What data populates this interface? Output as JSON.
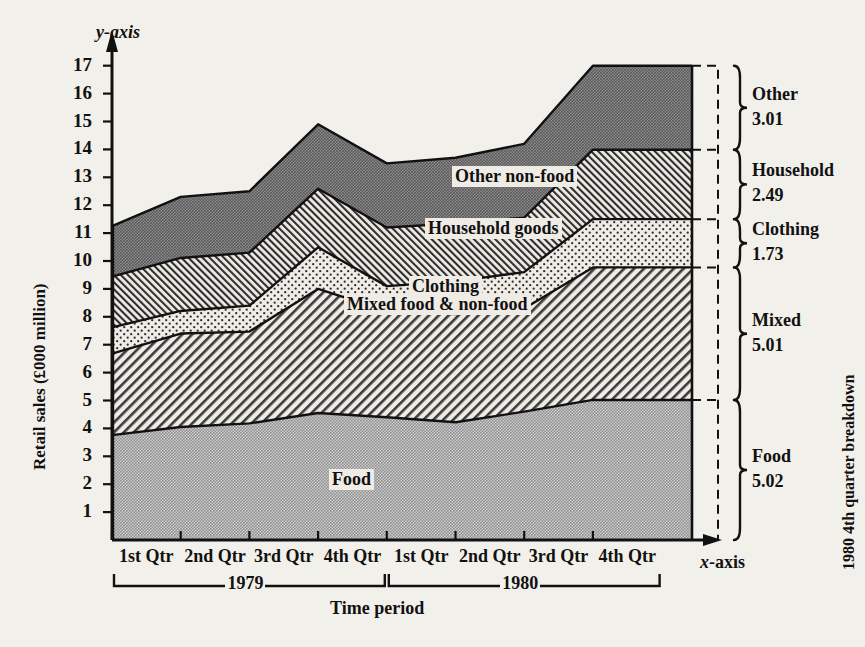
{
  "chart_data": {
    "type": "area",
    "title": "",
    "xlabel": "Time period",
    "ylabel": "Retail sales (£000 million)",
    "x_axis_name": "x-axis",
    "y_axis_name": "y-axis",
    "ylim": [
      0,
      17.6
    ],
    "yticks": [
      1,
      2,
      3,
      4,
      5,
      6,
      7,
      8,
      9,
      10,
      11,
      12,
      13,
      14,
      15,
      16,
      17
    ],
    "grid": false,
    "stacked": true,
    "categories": [
      "1st Qtr",
      "2nd Qtr",
      "3rd Qtr",
      "4th Qtr",
      "1st Qtr",
      "2nd Qtr",
      "3rd Qtr",
      "4th Qtr"
    ],
    "group_labels": [
      {
        "label": "1979",
        "from": 0,
        "to": 3
      },
      {
        "label": "1980",
        "from": 4,
        "to": 7
      }
    ],
    "series": [
      {
        "name": "Food",
        "values": [
          3.76,
          4.05,
          4.18,
          4.55,
          4.4,
          4.22,
          4.6,
          5.02
        ],
        "pattern": "solid-gray",
        "label": "Food"
      },
      {
        "name": "Mixed food & non-food",
        "values": [
          2.92,
          3.35,
          3.29,
          4.45,
          3.8,
          3.88,
          3.7,
          4.75
        ],
        "pattern": "diag-left",
        "label": "Mixed food & non-food"
      },
      {
        "name": "Clothing",
        "values": [
          0.94,
          0.81,
          0.93,
          1.49,
          0.9,
          1.17,
          1.3,
          1.73
        ],
        "pattern": "light-dots",
        "label": "Clothing"
      },
      {
        "name": "Household goods",
        "values": [
          1.82,
          1.9,
          1.9,
          2.1,
          2.1,
          2.08,
          1.95,
          2.49
        ],
        "pattern": "diag-right",
        "label": "Household goods"
      },
      {
        "name": "Other non-food",
        "values": [
          1.81,
          2.19,
          2.2,
          2.31,
          2.3,
          2.35,
          2.65,
          3.01
        ],
        "pattern": "dark-dots",
        "label": "Other non-food"
      }
    ],
    "cumulative_tops": {
      "Food": [
        3.76,
        4.05,
        4.18,
        4.55,
        4.4,
        4.22,
        4.6,
        5.02
      ],
      "Mixed food & non-food": [
        6.68,
        7.4,
        7.47,
        9.0,
        8.2,
        8.1,
        8.3,
        9.77
      ],
      "Clothing": [
        7.62,
        8.21,
        8.4,
        10.49,
        9.1,
        9.27,
        9.6,
        11.5
      ],
      "Household goods": [
        9.44,
        10.11,
        10.3,
        12.59,
        11.2,
        11.35,
        11.55,
        13.99
      ],
      "Other non-food": [
        11.25,
        12.3,
        12.5,
        14.9,
        13.5,
        13.7,
        14.2,
        17.0
      ]
    },
    "breakdown": {
      "title": "1980 4th quarter breakdown",
      "items": [
        {
          "name": "Other",
          "value": "3.01"
        },
        {
          "name": "Household",
          "value": "2.49"
        },
        {
          "name": "Clothing",
          "value": "1.73"
        },
        {
          "name": "Mixed",
          "value": "5.01"
        },
        {
          "name": "Food",
          "value": "5.02"
        }
      ]
    }
  },
  "axis": {
    "y_title": "Retail sales (£000 million)",
    "y_name_italic": "y",
    "y_name_rest": "-axis",
    "x_name_italic": "x",
    "x_name_rest": "-axis",
    "x_title": "Time period"
  },
  "colors": {
    "background": "#f2f0eb",
    "ink": "#111111",
    "food_fill": "#a9a9a9",
    "other_fill": "#8c8c8c",
    "paper_tint": "#efece6"
  }
}
